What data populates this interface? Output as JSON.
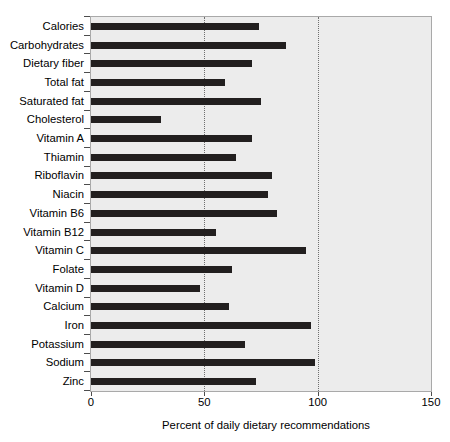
{
  "chart_data": {
    "type": "bar",
    "orientation": "horizontal",
    "title": "",
    "xlabel": "Percent of daily dietary recommendations",
    "ylabel": "",
    "xlim": [
      0,
      150
    ],
    "xticks": [
      0,
      50,
      100,
      150
    ],
    "xtick_labels": [
      "0",
      "50",
      "100",
      "150"
    ],
    "grid": true,
    "gridlines_at": [
      50,
      100
    ],
    "legend": null,
    "bar_color": "#221f1f",
    "plot_background": "#ececec",
    "categories": [
      "Calories",
      "Carbohydrates",
      "Dietary fiber",
      "Total fat",
      "Saturated fat",
      "Cholesterol",
      "Vitamin A",
      "Thiamin",
      "Riboflavin",
      "Niacin",
      "Vitamin B6",
      "Vitamin B12",
      "Vitamin C",
      "Folate",
      "Vitamin D",
      "Calcium",
      "Iron",
      "Potassium",
      "Sodium",
      "Zinc"
    ],
    "values": [
      74,
      86,
      71,
      59,
      75,
      31,
      71,
      64,
      80,
      78,
      82,
      55,
      95,
      62,
      48,
      61,
      97,
      68,
      99,
      73
    ]
  }
}
